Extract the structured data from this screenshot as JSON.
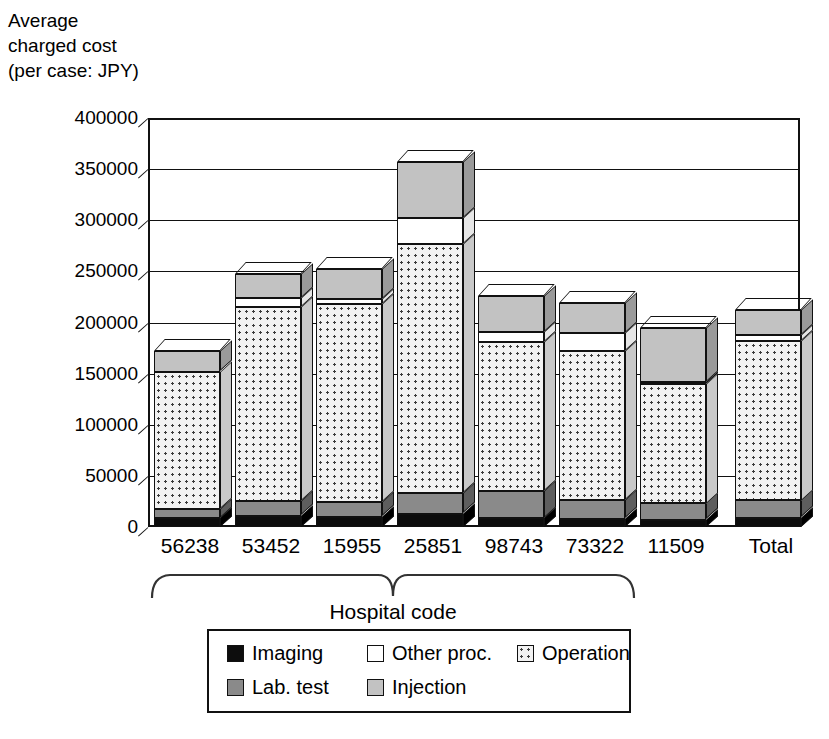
{
  "axis_title": "Average\ncharged cost\n(per case: JPY)",
  "group_label": "Hospital code",
  "legend": {
    "row1": [
      {
        "label": "Imaging",
        "key": "imaging",
        "left": 0
      },
      {
        "label": "Other proc.",
        "key": "other",
        "left": 140
      },
      {
        "label": "Operation",
        "key": "operation",
        "left": 290
      }
    ],
    "row2": [
      {
        "label": "Lab. test",
        "key": "lab",
        "left": 0
      },
      {
        "label": "Injection",
        "key": "injection",
        "left": 140
      }
    ]
  },
  "chart_data": {
    "type": "bar",
    "subtype": "stacked-3d",
    "title": "",
    "xlabel": "Hospital code",
    "ylabel": "Average charged cost (per case: JPY)",
    "ylim": [
      0,
      400000
    ],
    "ytick_step": 50000,
    "yticks": [
      "0",
      "50000",
      "100000",
      "150000",
      "200000",
      "250000",
      "300000",
      "350000",
      "400000"
    ],
    "grid": true,
    "legend_position": "bottom",
    "categories": [
      "56238",
      "53452",
      "15955",
      "25851",
      "98743",
      "73322",
      "11509",
      "Total"
    ],
    "series": [
      {
        "name": "Imaging",
        "key": "imaging",
        "color": "#0d0d0d",
        "values": [
          9000,
          11000,
          10000,
          13000,
          9000,
          8000,
          7000,
          9000
        ]
      },
      {
        "name": "Lab. test",
        "key": "lab",
        "color": "#8a8a8a",
        "values": [
          9000,
          14000,
          14000,
          20000,
          26000,
          18000,
          16000,
          17000
        ]
      },
      {
        "name": "Operation",
        "key": "operation",
        "color": "#f2f2f2",
        "values": [
          134000,
          190000,
          194000,
          244000,
          146000,
          146000,
          117000,
          156000
        ]
      },
      {
        "name": "Other proc.",
        "key": "other",
        "color": "#ffffff",
        "values": [
          0,
          9000,
          5000,
          25000,
          10000,
          18000,
          2000,
          6000
        ]
      },
      {
        "name": "Injection",
        "key": "injection",
        "color": "#c2c2c2",
        "values": [
          20000,
          23000,
          29000,
          55000,
          35000,
          29000,
          53000,
          24000
        ]
      }
    ],
    "totals": [
      172000,
      247000,
      252000,
      357000,
      226000,
      219000,
      195000,
      212000
    ]
  }
}
